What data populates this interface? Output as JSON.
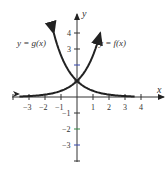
{
  "chart_data": {
    "type": "line",
    "title": "",
    "xlabel": "x",
    "ylabel": "y",
    "xlim": [
      -4,
      4
    ],
    "ylim": [
      -4,
      5
    ],
    "grid": false,
    "x_tick_labels": [
      "-3",
      "-2",
      "-1",
      "1",
      "2",
      "3",
      "4"
    ],
    "y_tick_labels": [
      "4",
      "3",
      "-1",
      "-2",
      "-3"
    ],
    "series": [
      {
        "name": "y = f(x)",
        "label": "y = f(x)",
        "formula": "2^x",
        "x": [
          -4,
          -3,
          -2,
          -1,
          0,
          1,
          2
        ],
        "values": [
          0.0625,
          0.125,
          0.25,
          0.5,
          1,
          2,
          4
        ]
      },
      {
        "name": "y = g(x)",
        "label": "y = g(x)",
        "formula": "2^-x",
        "x": [
          -2,
          -1,
          0,
          1,
          2,
          3,
          4
        ],
        "values": [
          4,
          2,
          1,
          0.5,
          0.25,
          0.125,
          0.0625
        ]
      }
    ],
    "annotations": [
      "y = g(x)",
      "y = f(x)"
    ]
  },
  "labels": {
    "x_axis": "x",
    "y_axis": "y",
    "f_label": "y = f(x)",
    "g_label": "y = g(x)"
  }
}
